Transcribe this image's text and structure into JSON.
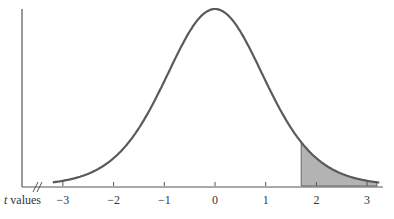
{
  "chart_data": {
    "type": "area",
    "title": "",
    "xlabel": "t values",
    "xlabel_italic_part": "t",
    "xlabel_rest": " values",
    "ylabel": "",
    "x_ticks": [
      -3,
      -2,
      -1,
      0,
      1,
      2,
      3
    ],
    "x_tick_labels": [
      "−3",
      "−2",
      "−1",
      "0",
      "1",
      "2",
      "3"
    ],
    "xlim": [
      -3.2,
      3.3
    ],
    "curve": "t-distribution density (bell-shaped, centered at 0)",
    "shaded_region": {
      "from": 1.7,
      "to": 3.2,
      "description": "right-tail area"
    },
    "axis_break": true,
    "grid": false,
    "legend": null
  },
  "colors": {
    "curve": "#5a5a5a",
    "shade": "#b3b3b3",
    "axis": "#555555"
  }
}
